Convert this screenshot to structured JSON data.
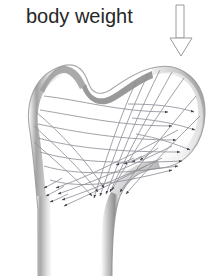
{
  "figure": {
    "title": "body weight",
    "background_color": "#ffffff"
  },
  "label": {
    "text": "body weight",
    "color": "#262626",
    "font_size_px": 20,
    "x": 26,
    "y": 4
  },
  "load_arrow": {
    "name": "body-weight-arrow",
    "direction": "down",
    "style": "hollow-outline",
    "stroke_color": "#9a9a9a",
    "fill_color": "#ffffff",
    "shaft": {
      "x_left": 176,
      "x_right": 184,
      "y_top": 5,
      "y_bottom": 38
    },
    "head": {
      "x_left": 170,
      "x_right": 192,
      "y_top": 38,
      "y_tip": 56
    }
  },
  "bone": {
    "name": "proximal-femur",
    "outline_color": "#8c8c8c",
    "cortex_dark": "#8a8a8a",
    "cortex_mid": "#b5b5b5",
    "cortex_light": "#e2e2e2",
    "interior_color": "#ffffff",
    "parts": [
      {
        "name": "greater-trochanter",
        "side": "left",
        "apex_x": 62,
        "apex_y": 66
      },
      {
        "name": "trochanteric-fossa-notch",
        "x": 92,
        "y": 92
      },
      {
        "name": "femoral-head",
        "side": "right",
        "center_x": 172,
        "center_y": 115,
        "radius": 46
      },
      {
        "name": "femoral-neck",
        "x": 140,
        "y": 120
      },
      {
        "name": "lesser-trochanter",
        "x": 168,
        "y": 168
      },
      {
        "name": "femoral-shaft",
        "x_left": 38,
        "x_right": 120,
        "y_top": 180,
        "y_bottom": 276
      },
      {
        "name": "medullary-cavity",
        "x_left": 58,
        "x_right": 98,
        "y_top": 190,
        "y_bottom": 276
      }
    ]
  },
  "trajectories": {
    "name": "trabecular-stress-lines",
    "stroke_color": "#8d8d96",
    "arrowhead_color": "#3a3a46",
    "families": [
      {
        "name": "compressive-trajectories",
        "description": "curves sweeping from femoral head down into medial cortex of shaft",
        "count": 9
      },
      {
        "name": "tensile-trajectories",
        "description": "curves sweeping from greater trochanter across the neck toward the head",
        "count": 8
      }
    ],
    "arrowhead_count": 44
  }
}
